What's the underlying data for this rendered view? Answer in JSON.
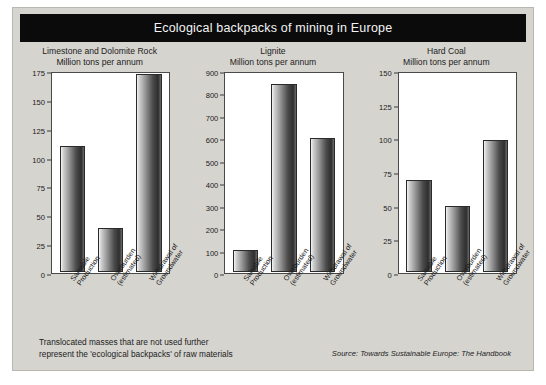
{
  "title": "Ecological backpacks of mining in Europe",
  "note": {
    "line1": "Translocated masses that are not used further",
    "line2": "represent the 'ecological backpacks' of raw materials"
  },
  "source": "Source: Towards Sustainable Europe: The Handbook",
  "colors": {
    "title_bar": "#0b0b0b",
    "title_text": "#f4f4f4",
    "figure_background": "#d6d4cf",
    "plot_background": "#ffffff",
    "axis": "#4a4a4a",
    "bar_dark": "#2e2e2e",
    "bar_light": "#f3f3f3"
  },
  "chart_data": [
    {
      "type": "bar",
      "title": "Limestone and Dolomite Rock",
      "subtitle": "Million tons per annum",
      "xlabel": "",
      "ylabel": "Million tons per annum",
      "ylim": [
        0,
        175
      ],
      "yticks": [
        0,
        25,
        50,
        75,
        100,
        125,
        150,
        175
      ],
      "grid": false,
      "legend": "none",
      "categories": [
        "Saleable Production",
        "Overburden (estimated)",
        "Withdrawal of Groundwater"
      ],
      "category_lines": [
        [
          "Saleable",
          "Production"
        ],
        [
          "Overburden",
          "(estimated)"
        ],
        [
          "Withdrawal of",
          "Groundwater"
        ]
      ],
      "values": [
        111,
        39,
        175
      ]
    },
    {
      "type": "bar",
      "title": "Lignite",
      "subtitle": "Million tons per annum",
      "xlabel": "",
      "ylabel": "Million tons per annum",
      "ylim": [
        0,
        900
      ],
      "yticks": [
        0,
        100,
        200,
        300,
        400,
        500,
        600,
        700,
        800,
        900
      ],
      "grid": false,
      "legend": "none",
      "categories": [
        "Saleable Production",
        "Overburden (estimated)",
        "Withdrawal of Groundwater"
      ],
      "category_lines": [
        [
          "Saleable",
          "Production"
        ],
        [
          "Overburden",
          "(estimated)"
        ],
        [
          "Withdrawal of",
          "Groundwater"
        ]
      ],
      "values": [
        98,
        855,
        610
      ]
    },
    {
      "type": "bar",
      "title": "Hard Coal",
      "subtitle": "Million tons per annum",
      "xlabel": "",
      "ylabel": "Million tons per annum",
      "ylim": [
        0,
        150
      ],
      "yticks": [
        0,
        25,
        50,
        75,
        100,
        125,
        150
      ],
      "grid": false,
      "legend": "none",
      "categories": [
        "Saleable Production",
        "Overburden (estimated)",
        "Withdrawal of Groundwater"
      ],
      "category_lines": [
        [
          "Saleable",
          "Production"
        ],
        [
          "Overburden",
          "(estimated)"
        ],
        [
          "Withdrawal of",
          "Groundwater"
        ]
      ],
      "values": [
        70,
        50,
        100
      ]
    }
  ]
}
